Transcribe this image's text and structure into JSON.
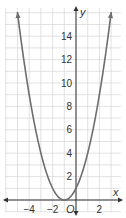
{
  "chart_data": {
    "type": "line",
    "title": "",
    "xlabel": "x",
    "ylabel": "y",
    "origin_label": "O",
    "xlim": [
      -5,
      4
    ],
    "ylim": [
      -1,
      16
    ],
    "grid": true,
    "x_ticks": [
      -4,
      -2,
      2
    ],
    "x_tick_labels": [
      "−4",
      "−2",
      "2"
    ],
    "y_ticks": [
      2,
      4,
      6,
      8,
      10,
      12,
      14
    ],
    "y_tick_labels": [
      "2",
      "4",
      "6",
      "8",
      "10",
      "12",
      "14"
    ],
    "function": "y = (x + 1)^2",
    "vertex": [
      -1,
      0
    ],
    "series": [
      {
        "name": "parabola",
        "x": [
          -5,
          -4.5,
          -4,
          -3.5,
          -3,
          -2.5,
          -2,
          -1.5,
          -1,
          -0.5,
          0,
          0.5,
          1,
          1.5,
          2,
          2.5,
          3
        ],
        "y": [
          16,
          12.25,
          9,
          6.25,
          4,
          2.25,
          1,
          0.25,
          0,
          0.25,
          1,
          2.25,
          4,
          6.25,
          9,
          12.25,
          16
        ]
      }
    ],
    "colors": {
      "curve": "#6e6e6e",
      "axis": "#333333",
      "grid": "#d6d6d6"
    }
  }
}
